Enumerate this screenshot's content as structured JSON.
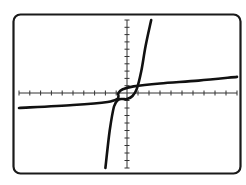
{
  "chart_data": {
    "type": "line",
    "title": "",
    "xlabel": "",
    "ylabel": "",
    "grid": false,
    "legend": null,
    "axes": {
      "x_ticks_left": 10,
      "x_ticks_right": 10,
      "y_ticks_up": 10,
      "y_ticks_down": 10
    },
    "xlim": [
      -10,
      10
    ],
    "ylim": [
      -10,
      10
    ],
    "series": [
      {
        "name": "steep-curve",
        "description": "cubic-like increasing curve, steep, inflection just below origin",
        "points": [
          [
            -2.0,
            -10.0
          ],
          [
            -1.6,
            -5.0
          ],
          [
            -1.2,
            -1.8
          ],
          [
            -0.8,
            -0.9
          ],
          [
            -0.4,
            -0.8
          ],
          [
            0.0,
            -0.8
          ],
          [
            0.5,
            -0.4
          ],
          [
            0.9,
            0.6
          ],
          [
            1.3,
            3.0
          ],
          [
            1.7,
            6.5
          ],
          [
            2.2,
            10.0
          ]
        ]
      },
      {
        "name": "flat-curve",
        "description": "inverse (cube-root-like) curve, nearly flat, inflection just left of origin",
        "points": [
          [
            -10.0,
            -2.0
          ],
          [
            -5.0,
            -1.6
          ],
          [
            -1.8,
            -1.2
          ],
          [
            -0.9,
            -0.8
          ],
          [
            -0.8,
            -0.4
          ],
          [
            -0.8,
            0.0
          ],
          [
            -0.4,
            0.5
          ],
          [
            0.6,
            0.9
          ],
          [
            3.0,
            1.3
          ],
          [
            6.5,
            1.7
          ],
          [
            10.0,
            2.2
          ]
        ]
      }
    ]
  },
  "colors": {
    "frame": "#1a1a1a",
    "curve": "#111111",
    "axis": "#333333",
    "background": "#ffffff"
  }
}
